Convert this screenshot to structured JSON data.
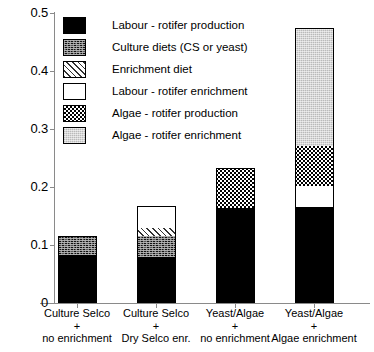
{
  "chart_data": {
    "type": "bar",
    "stacked": true,
    "title": "",
    "xlabel": "",
    "ylabel": "",
    "ylim": [
      0,
      0.5
    ],
    "grid": false,
    "legend_position": "top-left inside plot",
    "ytick_labels": [
      "0.5",
      "0.4",
      "0.3",
      "0.2",
      "0.1",
      "0"
    ],
    "ytick_values": [
      0.5,
      0.4,
      0.3,
      0.2,
      0.1,
      0
    ],
    "categories": [
      "Culture Selco\n+\nno enrichment",
      "Culture Selco\n+\nDry Selco enr.",
      "Yeast/Algae\n+\nno enrichment",
      "Yeast/Algae\n+\nAlgae enrichment"
    ],
    "category_lines": [
      [
        "Culture Selco",
        "+",
        "no enrichment"
      ],
      [
        "Culture Selco",
        "+",
        "Dry Selco enr."
      ],
      [
        "Yeast/Algae",
        "+",
        "no enrichment"
      ],
      [
        "Yeast/Algae",
        "+",
        "Algae enrichment"
      ]
    ],
    "series": [
      {
        "name": "Labour - rotifer production",
        "pattern": "solid-black",
        "values": [
          0.082,
          0.08,
          0.163,
          0.165
        ]
      },
      {
        "name": "Culture diets (CS or yeast)",
        "pattern": "dark-speckle",
        "values": [
          0.033,
          0.036,
          0.0,
          0.0
        ]
      },
      {
        "name": "Enrichment diet",
        "pattern": "diagonal-hatch",
        "values": [
          0.0,
          0.014,
          0.0,
          0.0
        ]
      },
      {
        "name": "Labour - rotifer enrichment",
        "pattern": "white",
        "values": [
          0.0,
          0.038,
          0.0,
          0.037
        ]
      },
      {
        "name": "Algae - rotifer production",
        "pattern": "checkerboard",
        "values": [
          0.0,
          0.0,
          0.069,
          0.069
        ]
      },
      {
        "name": "Algae - rotifer enrichment",
        "pattern": "light-grey-stipple",
        "values": [
          0.0,
          0.0,
          0.0,
          0.203
        ]
      }
    ],
    "totals": [
      0.115,
      0.168,
      0.232,
      0.437
    ]
  },
  "legend": {
    "items": [
      {
        "label": "Labour - rotifer production",
        "swatch": "solid-black"
      },
      {
        "label": "Culture diets (CS or yeast)",
        "swatch": "dark-speckle"
      },
      {
        "label": "Enrichment diet",
        "swatch": "diagonal-hatch"
      },
      {
        "label": "Labour - rotifer enrichment",
        "swatch": "white"
      },
      {
        "label": "Algae - rotifer production",
        "swatch": "checkerboard"
      },
      {
        "label": "Algae - rotifer enrichment",
        "swatch": "light-grey-stipple"
      }
    ]
  },
  "axis": {
    "y_labels": [
      "0.5",
      "0.4",
      "0.3",
      "0.2",
      "0.1",
      "0"
    ]
  },
  "colors": {
    "axis": "#8a8a8a",
    "ink": "#000000",
    "background": "#ffffff",
    "light_grey_fill": "#d6d6d6"
  }
}
